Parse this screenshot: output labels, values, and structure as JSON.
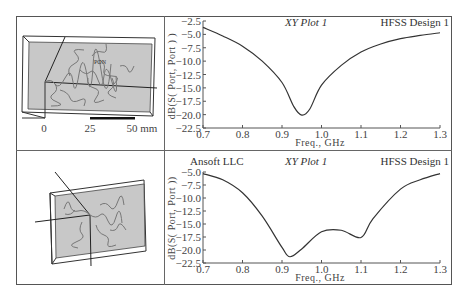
{
  "panels": [
    {
      "model": {
        "label": "PON",
        "scale_bar": {
          "ticks": [
            "0",
            "25",
            "50 mm"
          ]
        }
      },
      "plot": {
        "corner_left": "",
        "title": "XY Plot 1",
        "design": "HFSS Design 1",
        "ylabel": "dB(S( Port, Port ) )",
        "xlabel": "Freq., GHz"
      }
    },
    {
      "model": {
        "label": ""
      },
      "plot": {
        "corner_left": "Ansoft LLC",
        "title": "XY Plot 1",
        "design": "HFSS Design 1",
        "ylabel": "dB(S( Port, Port ))",
        "xlabel": "Freq., GHz"
      }
    }
  ],
  "chart_data": [
    {
      "type": "line",
      "title": "XY Plot 1",
      "subtitle": "HFSS Design 1",
      "xlabel": "Freq., GHz",
      "ylabel": "dB(S( Port, Port ) )",
      "xlim": [
        0.7,
        1.3
      ],
      "ylim": [
        -22.5,
        -2.5
      ],
      "xticks": [
        "0.7",
        "0.8",
        "0.9",
        "1.0",
        "1.1",
        "1.2",
        "1.3"
      ],
      "yticks": [
        "-2.5",
        "-5.0",
        "-7.5",
        "-10.0",
        "-12.5",
        "-15.0",
        "-17.5",
        "-20.0",
        "-22.5"
      ],
      "grid": false,
      "series": [
        {
          "name": "dB(S(Port,Port))",
          "x": [
            0.7,
            0.75,
            0.8,
            0.85,
            0.9,
            0.93,
            0.95,
            0.97,
            1.0,
            1.05,
            1.1,
            1.15,
            1.2,
            1.25,
            1.3
          ],
          "y": [
            -3.7,
            -5.3,
            -7.2,
            -10.0,
            -14.0,
            -18.5,
            -20.1,
            -19.0,
            -14.5,
            -10.8,
            -8.3,
            -6.8,
            -5.8,
            -5.2,
            -4.7
          ]
        }
      ]
    },
    {
      "type": "line",
      "title": "XY Plot 1",
      "subtitle": "HFSS Design 1",
      "annotation": "Ansoft LLC",
      "xlabel": "Freq., GHz",
      "ylabel": "dB(S( Port, Port ))",
      "xlim": [
        0.7,
        1.3
      ],
      "ylim": [
        -22.5,
        -5.0
      ],
      "xticks": [
        "0.7",
        "0.8",
        "0.9",
        "1.0",
        "1.1",
        "1.2",
        "1.3"
      ],
      "yticks": [
        "-5.0",
        "-7.5",
        "-10.0",
        "-12.5",
        "-15.0",
        "-17.5",
        "-20.0",
        "-22.5"
      ],
      "grid": false,
      "series": [
        {
          "name": "dB(S(Port,Port))",
          "x": [
            0.7,
            0.75,
            0.8,
            0.85,
            0.9,
            0.92,
            0.95,
            1.0,
            1.05,
            1.1,
            1.13,
            1.2,
            1.25,
            1.3
          ],
          "y": [
            -5.3,
            -6.5,
            -9.0,
            -13.5,
            -19.5,
            -21.3,
            -19.8,
            -16.5,
            -16.2,
            -17.6,
            -14.0,
            -8.3,
            -6.5,
            -5.3
          ]
        }
      ]
    }
  ]
}
